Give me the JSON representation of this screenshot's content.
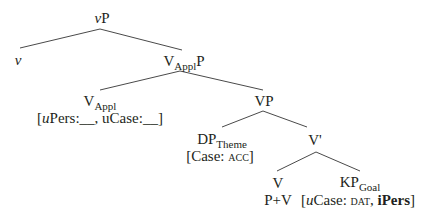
{
  "tree": {
    "nodes": {
      "vP": {
        "italic_part": "v",
        "rest": "P"
      },
      "v": {
        "label": "v"
      },
      "VApplP": {
        "base": "V",
        "sub": "Appl",
        "suffix": "P"
      },
      "VAppl": {
        "base": "V",
        "sub": "Appl",
        "features": {
          "open": "[",
          "upers_u": "u",
          "upers_rest": "Pers:__, uCase:__",
          "close": "]"
        }
      },
      "VP": {
        "label": "VP"
      },
      "DPTheme": {
        "base": "DP",
        "sub": "Theme",
        "features": {
          "open": "[Case: ",
          "case_value": "acc",
          "close": "]"
        }
      },
      "Vbar": {
        "label": "V'"
      },
      "V": {
        "label": "V",
        "content": "P+V"
      },
      "KPGoal": {
        "base": "KP",
        "sub": "Goal",
        "features": {
          "open": "[",
          "u": "u",
          "case_label": "Case: ",
          "case_value": "dat",
          "sep": ", ",
          "ipers": "iPers",
          "close": "]"
        }
      }
    },
    "edges": [
      {
        "from": "vP",
        "to": "v",
        "x1": 100,
        "y1": 29,
        "x2": 20,
        "y2": 48
      },
      {
        "from": "vP",
        "to": "VApplP",
        "x1": 100,
        "y1": 29,
        "x2": 182,
        "y2": 50
      },
      {
        "from": "VApplP",
        "to": "VAppl",
        "x1": 180,
        "y1": 71,
        "x2": 100,
        "y2": 90
      },
      {
        "from": "VApplP",
        "to": "VP",
        "x1": 180,
        "y1": 71,
        "x2": 263,
        "y2": 90
      },
      {
        "from": "VP",
        "to": "DPTheme",
        "x1": 263,
        "y1": 111,
        "x2": 222,
        "y2": 127
      },
      {
        "from": "VP",
        "to": "Vbar",
        "x1": 263,
        "y1": 111,
        "x2": 307,
        "y2": 127
      },
      {
        "from": "Vbar",
        "to": "V",
        "x1": 316,
        "y1": 152,
        "x2": 277,
        "y2": 171
      },
      {
        "from": "Vbar",
        "to": "KPGoal",
        "x1": 316,
        "y1": 152,
        "x2": 360,
        "y2": 171
      }
    ],
    "line_color": "#4a4a4a",
    "text_color": "#231f20"
  }
}
